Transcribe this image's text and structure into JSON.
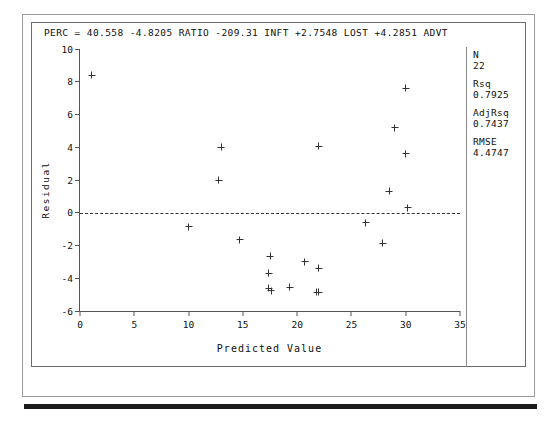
{
  "page": {
    "background": "#ffffff",
    "frame_color": "#9a9a9a",
    "bottom_bar_color": "#1b1b1b"
  },
  "plot": {
    "model_equation": "PERC = 40.558 -4.8205 RATIO -209.31 INFT +2.7548 LOST +4.2851 ADVT",
    "marker_color": "#333333",
    "axis_color": "#555555"
  },
  "stats": [
    {
      "name": "N",
      "value": "22"
    },
    {
      "name": "Rsq",
      "value": "0.7925"
    },
    {
      "name": "AdjRsq",
      "value": "0.7437"
    },
    {
      "name": "RMSE",
      "value": "4.4747"
    }
  ],
  "chart_data": {
    "type": "scatter",
    "title": "PERC = 40.558 -4.8205 RATIO -209.31 INFT +2.7548 LOST +4.2851 ADVT",
    "xlabel": "Predicted Value",
    "ylabel": "Residual",
    "xlim": [
      0,
      35
    ],
    "ylim": [
      -6,
      10
    ],
    "xticks": [
      0,
      5,
      10,
      15,
      20,
      25,
      30,
      35
    ],
    "yticks": [
      10,
      8,
      6,
      4,
      2,
      0,
      -2,
      -4,
      -6
    ],
    "grid": false,
    "legend": false,
    "reference_line": {
      "y": 0,
      "style": "dashed",
      "color": "#333333"
    },
    "marker": "plus",
    "n_points": 22,
    "points": [
      {
        "x": 1.1,
        "y": 8.4
      },
      {
        "x": 13.0,
        "y": 4.0
      },
      {
        "x": 12.8,
        "y": 2.0
      },
      {
        "x": 22.0,
        "y": 4.05
      },
      {
        "x": 30.0,
        "y": 7.6
      },
      {
        "x": 29.0,
        "y": 5.2
      },
      {
        "x": 30.0,
        "y": 3.6
      },
      {
        "x": 28.5,
        "y": 1.3
      },
      {
        "x": 30.2,
        "y": 0.3
      },
      {
        "x": 10.0,
        "y": -0.85
      },
      {
        "x": 14.7,
        "y": -1.65
      },
      {
        "x": 26.3,
        "y": -0.6
      },
      {
        "x": 27.9,
        "y": -1.85
      },
      {
        "x": 17.5,
        "y": -2.65
      },
      {
        "x": 20.7,
        "y": -3.0
      },
      {
        "x": 22.0,
        "y": -3.4
      },
      {
        "x": 17.4,
        "y": -3.7
      },
      {
        "x": 17.4,
        "y": -4.6
      },
      {
        "x": 17.6,
        "y": -4.75
      },
      {
        "x": 19.3,
        "y": -4.55
      },
      {
        "x": 21.8,
        "y": -4.85
      },
      {
        "x": 22.0,
        "y": -4.85
      }
    ]
  }
}
